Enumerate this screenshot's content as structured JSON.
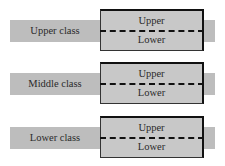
{
  "diagram": {
    "rows": [
      {
        "label": "Upper class",
        "upper": "Upper",
        "lower": "Lower"
      },
      {
        "label": "Middle class",
        "upper": "Upper",
        "lower": "Lower"
      },
      {
        "label": "Lower class",
        "upper": "Upper",
        "lower": "Lower"
      }
    ]
  },
  "colors": {
    "band": "#bdbdbd",
    "box": "#c8c8c8",
    "divider": "#111111"
  }
}
